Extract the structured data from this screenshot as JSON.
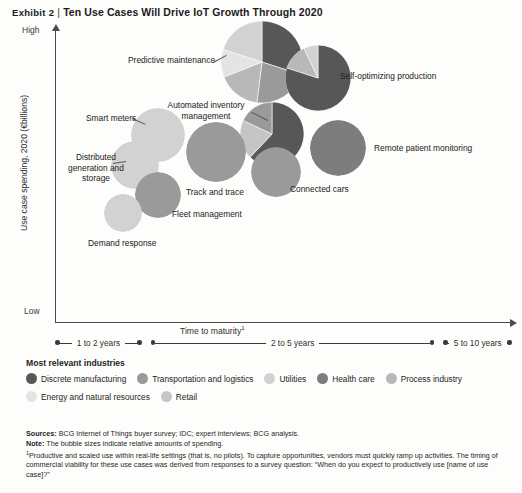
{
  "exhibit": {
    "label": "Exhibit 2",
    "separator": "|",
    "title": "Ten Use Cases Will Drive IoT Growth Through 2020"
  },
  "chart_data": {
    "type": "scatter",
    "title": "Ten Use Cases Will Drive IoT Growth Through 2020",
    "xlabel": "Time to maturity",
    "xlabel_footnote": "1",
    "ylabel": "Use case spending, 2020 (€billions)",
    "ylim_labels": [
      "Low",
      "High"
    ],
    "grid": false,
    "legend_position": "below-plot",
    "x_brackets": [
      {
        "label": "1 to 2 years",
        "left_pct": 0,
        "right_pct": 19
      },
      {
        "label": "2 to 5 years",
        "left_pct": 21,
        "right_pct": 83
      },
      {
        "label": "5 to 10 years",
        "left_pct": 85,
        "right_pct": 100
      }
    ],
    "note": "The bubble sizes indicate relative amounts of spending.",
    "bubbles": [
      {
        "name": "Predictive maintenance",
        "cx": 262,
        "cy": 62,
        "r": 41,
        "label_x": 128,
        "label_y": 55,
        "segments": [
          {
            "industry": "Discrete manufacturing",
            "share": 0.3
          },
          {
            "industry": "Transportation and logistics",
            "share": 0.22
          },
          {
            "industry": "Process industry",
            "share": 0.17
          },
          {
            "industry": "Energy and natural resources",
            "share": 0.11
          },
          {
            "industry": "Utilities",
            "share": 0.2
          }
        ]
      },
      {
        "name": "Self-optimizing production",
        "cx": 318,
        "cy": 78,
        "r": 33,
        "label_x": 340,
        "label_y": 71,
        "segments": [
          {
            "industry": "Discrete manufacturing",
            "share": 0.8
          },
          {
            "industry": "Process industry",
            "share": 0.13
          },
          {
            "industry": "Utilities",
            "share": 0.07
          }
        ]
      },
      {
        "name": "Automated inventory management",
        "cx": 272,
        "cy": 134,
        "r": 32,
        "label_x": 160,
        "label_y": 100,
        "segments": [
          {
            "industry": "Discrete manufacturing",
            "share": 0.62
          },
          {
            "industry": "Retail",
            "share": 0.2
          },
          {
            "industry": "Transportation and logistics",
            "share": 0.18
          }
        ]
      },
      {
        "name": "Remote patient monitoring",
        "cx": 338,
        "cy": 148,
        "r": 28,
        "label_x": 374,
        "label_y": 143,
        "segments": [
          {
            "industry": "Health care",
            "share": 1.0
          }
        ]
      },
      {
        "name": "Connected cars",
        "cx": 276,
        "cy": 172,
        "r": 25,
        "label_x": 290,
        "label_y": 184,
        "segments": [
          {
            "industry": "Transportation and logistics",
            "share": 1.0
          }
        ]
      },
      {
        "name": "Track and trace",
        "cx": 216,
        "cy": 152,
        "r": 30,
        "label_x": 186,
        "label_y": 187,
        "segments": [
          {
            "industry": "Transportation and logistics",
            "share": 1.0
          }
        ]
      },
      {
        "name": "Smart meters",
        "cx": 158,
        "cy": 135,
        "r": 27,
        "label_x": 86,
        "label_y": 113,
        "segments": [
          {
            "industry": "Utilities",
            "share": 1.0
          }
        ]
      },
      {
        "name": "Distributed generation and storage",
        "cx": 135,
        "cy": 165,
        "r": 24,
        "label_x": 66,
        "label_y": 152,
        "segments": [
          {
            "industry": "Utilities",
            "share": 1.0
          }
        ]
      },
      {
        "name": "Fleet management",
        "cx": 158,
        "cy": 195,
        "r": 23,
        "label_x": 172,
        "label_y": 209,
        "segments": [
          {
            "industry": "Transportation and logistics",
            "share": 1.0
          }
        ]
      },
      {
        "name": "Demand response",
        "cx": 123,
        "cy": 213,
        "r": 19,
        "label_x": 88,
        "label_y": 238,
        "segments": [
          {
            "industry": "Utilities",
            "share": 1.0
          }
        ]
      }
    ]
  },
  "legend": {
    "title": "Most relevant industries",
    "items": [
      {
        "label": "Discrete manufacturing",
        "color": "#575757"
      },
      {
        "label": "Transportation and logistics",
        "color": "#9a9a9a"
      },
      {
        "label": "Utilities",
        "color": "#d2d2d2"
      },
      {
        "label": "Health care",
        "color": "#7d7d7d"
      },
      {
        "label": "Process industry",
        "color": "#b8b8b8"
      },
      {
        "label": "Energy and natural resources",
        "color": "#e4e4e4"
      },
      {
        "label": "Retail",
        "color": "#c5c5c5"
      }
    ]
  },
  "footnotes": {
    "sources_label": "Sources:",
    "sources_text": "BCG Internet of Things buyer survey; IDC; expert interviews; BCG analysis.",
    "note_label": "Note:",
    "note_text": "The bubble sizes indicate relative amounts of spending.",
    "fn1_marker": "1",
    "fn1_text": "Productive and scaled use within real-life settings (that is, no pilots). To capture opportunities, vendors must quickly ramp up activities. The timing of commercial viability for these use cases was derived from responses to a survey question: “When do you expect to productively use [name of use case]?”"
  },
  "colors": {
    "discrete_manufacturing": "#575757",
    "transportation_logistics": "#9a9a9a",
    "utilities": "#d2d2d2",
    "health_care": "#7d7d7d",
    "process_industry": "#b8b8b8",
    "energy_natural_resources": "#e4e4e4",
    "retail": "#c5c5c5",
    "axis": "#4a4a4a",
    "background": "#fdfdfb"
  }
}
